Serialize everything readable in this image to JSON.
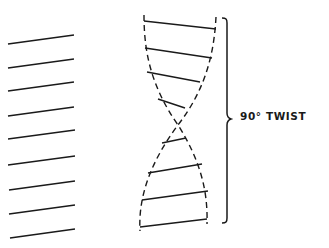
{
  "diagram": {
    "label": "90° TWIST",
    "colors": {
      "ink": "#1a1a1a",
      "background": "#ffffff"
    },
    "left_lines": [
      [
        8,
        44,
        74,
        35
      ],
      [
        8,
        68,
        74,
        59
      ],
      [
        8,
        91,
        74,
        82
      ],
      [
        8,
        116,
        74,
        107
      ],
      [
        8,
        139,
        75,
        130
      ],
      [
        8,
        165,
        75,
        156
      ],
      [
        9,
        190,
        75,
        181
      ],
      [
        9,
        214,
        75,
        205
      ],
      [
        10,
        238,
        75,
        229
      ]
    ],
    "twisted_bars": [
      [
        144,
        21,
        216,
        29
      ],
      [
        145,
        48,
        212,
        58
      ],
      [
        147,
        72,
        200,
        82
      ],
      [
        158,
        99,
        185,
        108
      ],
      [
        162,
        143,
        186,
        138
      ],
      [
        148,
        173,
        202,
        164
      ],
      [
        142,
        200,
        208,
        191
      ],
      [
        140,
        227,
        207,
        219
      ]
    ]
  }
}
